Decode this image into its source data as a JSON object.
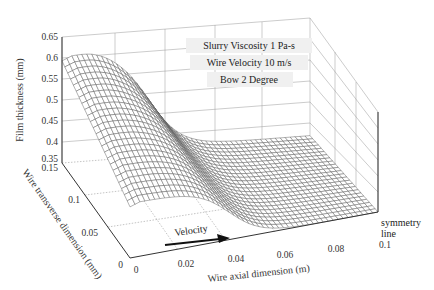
{
  "chart_data": {
    "type": "surface",
    "title": "",
    "zlabel": "Film thickness (mm)",
    "xlabel": "Wire axial dimension (m)",
    "ylabel": "Wire transverse dimension (mm)",
    "zticks": [
      "0.65",
      "0.6",
      "0.55",
      "0.5",
      "0.45",
      "0.4",
      "0.35"
    ],
    "xticks": [
      "0",
      "0.02",
      "0.04",
      "0.06",
      "0.08",
      "0.1"
    ],
    "yticks": [
      "0",
      "0.05",
      "0.1",
      "0.15"
    ],
    "zlim": [
      0.35,
      0.65
    ],
    "xlim": [
      0,
      0.1
    ],
    "ylim": [
      0,
      0.15
    ],
    "annotations": {
      "viscosity": "Slurry Viscosity  1 Pa-s",
      "velocity": "Wire Velocity  10 m/s",
      "bow": "Bow 2 Degree",
      "arrow_label": "Velocity",
      "symmetry_line": [
        "symmetry",
        "line"
      ]
    },
    "surface_profile": {
      "description": "Film thickness along axial dimension: high plateau near inlet, steep drop around 0.03-0.05 m, low plateau toward 0.1 m",
      "x": [
        0,
        0.01,
        0.02,
        0.03,
        0.04,
        0.05,
        0.06,
        0.07,
        0.08,
        0.09,
        0.1
      ],
      "z_at_y0.15": [
        0.59,
        0.6,
        0.585,
        0.52,
        0.44,
        0.4,
        0.39,
        0.385,
        0.38,
        0.375,
        0.37
      ],
      "z_at_y0": [
        0.48,
        0.49,
        0.475,
        0.43,
        0.38,
        0.36,
        0.355,
        0.352,
        0.35,
        0.35,
        0.35
      ]
    },
    "grid": true
  }
}
